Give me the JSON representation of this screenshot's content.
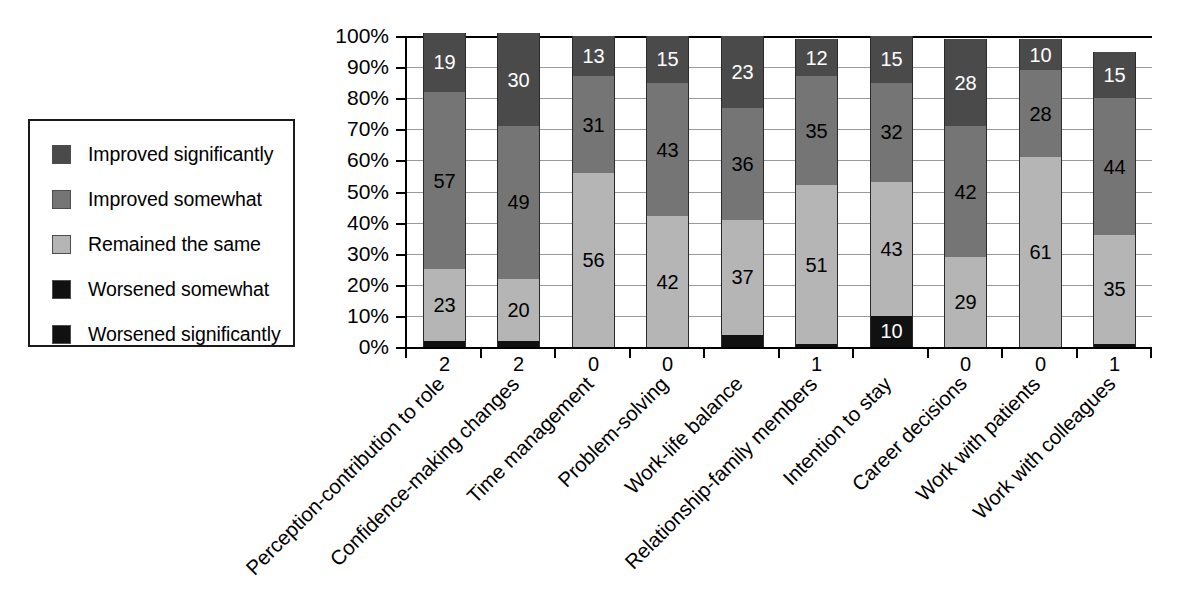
{
  "legend": {
    "items": [
      {
        "label": "Improved significantly",
        "color": "#4a4a4a",
        "swatch_name": "legend-swatch-improved-significantly"
      },
      {
        "label": "Improved somewhat",
        "color": "#757575",
        "swatch_name": "legend-swatch-improved-somewhat"
      },
      {
        "label": "Remained the same",
        "color": "#b5b5b5",
        "swatch_name": "legend-swatch-remained-the-same"
      },
      {
        "label": "Worsened somewhat",
        "color": "#111111",
        "swatch_name": "legend-swatch-worsened-somewhat"
      },
      {
        "label": "Worsened significantly",
        "color": "#111111",
        "swatch_name": "legend-swatch-worsened-significantly"
      }
    ]
  },
  "axis": {
    "y_ticks": [
      "100%",
      "90%",
      "80%",
      "70%",
      "60%",
      "50%",
      "40%",
      "30%",
      "20%",
      "10%",
      "0%"
    ]
  },
  "chart_data": {
    "type": "bar",
    "title": "",
    "xlabel": "",
    "ylabel": "",
    "ylim": [
      0,
      100
    ],
    "grid": true,
    "stacked": true,
    "legend_position": "left",
    "categories": [
      "Perception-contribution to role",
      "Confidence-making changes",
      "Time management",
      "Problem-solving",
      "Work-life balance",
      "Relationship-family members",
      "Intention to stay",
      "Career decisions",
      "Work with patients",
      "Work with colleagues"
    ],
    "series": [
      {
        "name": "Worsened significantly",
        "color": "#111111",
        "values": [
          0,
          0,
          0,
          0,
          0,
          0,
          0,
          0,
          0,
          0
        ]
      },
      {
        "name": "Worsened somewhat",
        "color": "#111111",
        "values": [
          2,
          2,
          0,
          0,
          4,
          1,
          10,
          0,
          0,
          1
        ]
      },
      {
        "name": "Remained the same",
        "color": "#b5b5b5",
        "values": [
          23,
          20,
          56,
          42,
          37,
          51,
          43,
          29,
          61,
          35
        ]
      },
      {
        "name": "Improved somewhat",
        "color": "#757575",
        "values": [
          57,
          49,
          31,
          43,
          36,
          35,
          32,
          42,
          28,
          44
        ]
      },
      {
        "name": "Improved significantly",
        "color": "#4a4a4a",
        "values": [
          19,
          30,
          13,
          15,
          23,
          12,
          15,
          28,
          10,
          15
        ]
      }
    ],
    "bar_labels": [
      {
        "category": "Perception-contribution to role",
        "worsened_somewhat": "2",
        "remained_the_same": "23",
        "improved_somewhat": "57",
        "improved_significantly": "19"
      },
      {
        "category": "Confidence-making changes",
        "worsened_somewhat": "2",
        "remained_the_same": "20",
        "improved_somewhat": "49",
        "improved_significantly": "30"
      },
      {
        "category": "Time management",
        "worsened_somewhat": "0",
        "remained_the_same": "56",
        "improved_somewhat": "31",
        "improved_significantly": "13"
      },
      {
        "category": "Problem-solving",
        "worsened_somewhat": "0",
        "remained_the_same": "42",
        "improved_somewhat": "43",
        "improved_significantly": "15"
      },
      {
        "category": "Work-life balance",
        "worsened_somewhat": "",
        "remained_the_same": "37",
        "improved_somewhat": "36",
        "improved_significantly": "23"
      },
      {
        "category": "Relationship-family members",
        "worsened_somewhat": "1",
        "remained_the_same": "51",
        "improved_somewhat": "35",
        "improved_significantly": "12"
      },
      {
        "category": "Intention to stay",
        "worsened_somewhat": "10",
        "remained_the_same": "43",
        "improved_somewhat": "32",
        "improved_significantly": "15"
      },
      {
        "category": "Career decisions",
        "worsened_somewhat": "0",
        "remained_the_same": "29",
        "improved_somewhat": "42",
        "improved_significantly": "28"
      },
      {
        "category": "Work with patients",
        "worsened_somewhat": "0",
        "remained_the_same": "61",
        "improved_somewhat": "28",
        "improved_significantly": "10"
      },
      {
        "category": "Work with colleagues",
        "worsened_somewhat": "1",
        "remained_the_same": "35",
        "improved_somewhat": "44",
        "improved_significantly": "15"
      }
    ]
  }
}
